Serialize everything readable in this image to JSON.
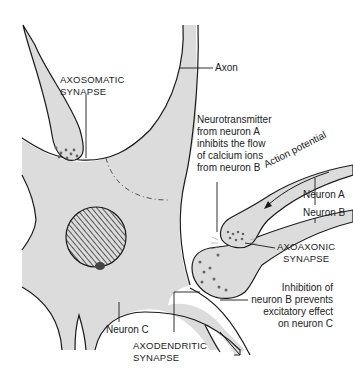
{
  "diagram": {
    "colors": {
      "cell_fill": "#dcdcdc",
      "outline": "#1a1a1a",
      "background": "#ffffff",
      "vesicle": "#555555"
    },
    "labels": {
      "axosomatic": [
        "AXOSOMATIC",
        "SYNAPSE"
      ],
      "axon": "Axon",
      "neurotransmitter_note": [
        "Neurotransmitter",
        "from neuron A",
        "inhibits the flow",
        "of calcium ions",
        "from neuron B"
      ],
      "action_potential": "Action potential",
      "neuron_a": "Neuron A",
      "neuron_b": "Neuron B",
      "axoaxonic": [
        "AXOAXONIC",
        "SYNAPSE"
      ],
      "inhibition_note": [
        "Inhibition of",
        "neuron B prevents",
        "excitatory effect",
        "on neuron C"
      ],
      "neuron_c": "Neuron C",
      "axodendritic": [
        "AXODENDRITIC",
        "SYNAPSE"
      ]
    },
    "structures": [
      "axon",
      "cell-body",
      "nucleus",
      "nucleolus",
      "neuron-a-axon",
      "neuron-b-axon",
      "axosomatic-terminal",
      "axoaxonic-terminal",
      "axodendritic-terminal",
      "dendrites"
    ]
  }
}
